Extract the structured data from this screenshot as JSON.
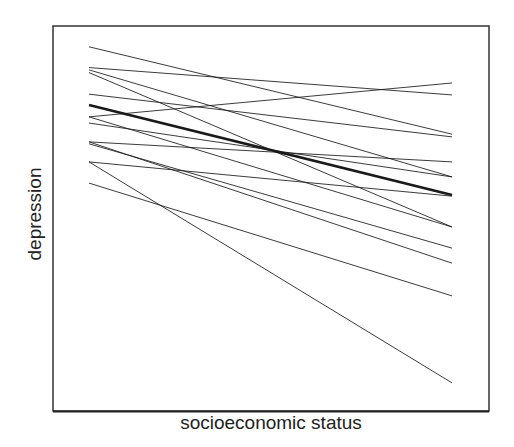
{
  "chart_data": {
    "type": "line",
    "title": "",
    "xlabel": "socioeconomic status",
    "ylabel": "depression",
    "xlim": [
      0,
      1
    ],
    "ylim": [
      0,
      100
    ],
    "grid": false,
    "legend": null,
    "x": [
      0,
      1
    ],
    "series": [
      {
        "name": "line-1",
        "values": [
          94.6,
          71.9
        ],
        "weight": 1
      },
      {
        "name": "line-2",
        "values": [
          89.2,
          82.1
        ],
        "weight": 1
      },
      {
        "name": "line-3",
        "values": [
          88.6,
          60.8
        ],
        "weight": 1
      },
      {
        "name": "line-4",
        "values": [
          87.9,
          47.8
        ],
        "weight": 1
      },
      {
        "name": "line-5",
        "values": [
          82.3,
          71.2
        ],
        "weight": 1
      },
      {
        "name": "average",
        "values": [
          79.5,
          56.1
        ],
        "weight": 2.6
      },
      {
        "name": "line-7",
        "values": [
          76.4,
          85.2
        ],
        "weight": 1
      },
      {
        "name": "line-8",
        "values": [
          76.4,
          47.8
        ],
        "weight": 1
      },
      {
        "name": "line-9",
        "values": [
          74.8,
          60.8
        ],
        "weight": 1
      },
      {
        "name": "line-10",
        "values": [
          69.9,
          64.7
        ],
        "weight": 1
      },
      {
        "name": "line-11",
        "values": [
          69.9,
          38.4
        ],
        "weight": 1
      },
      {
        "name": "line-12",
        "values": [
          69.4,
          42.3
        ],
        "weight": 1
      },
      {
        "name": "line-13",
        "values": [
          64.7,
          55.8
        ],
        "weight": 1
      },
      {
        "name": "line-14",
        "values": [
          64.7,
          7.3
        ],
        "weight": 1
      },
      {
        "name": "line-15",
        "values": [
          59.2,
          29.9
        ],
        "weight": 1
      }
    ]
  },
  "axes": {
    "xlabel": "socioeconomic status",
    "ylabel": "depression"
  },
  "colors": {
    "line": "#1a1a1a",
    "frame": "#333333",
    "background": "#ffffff"
  }
}
